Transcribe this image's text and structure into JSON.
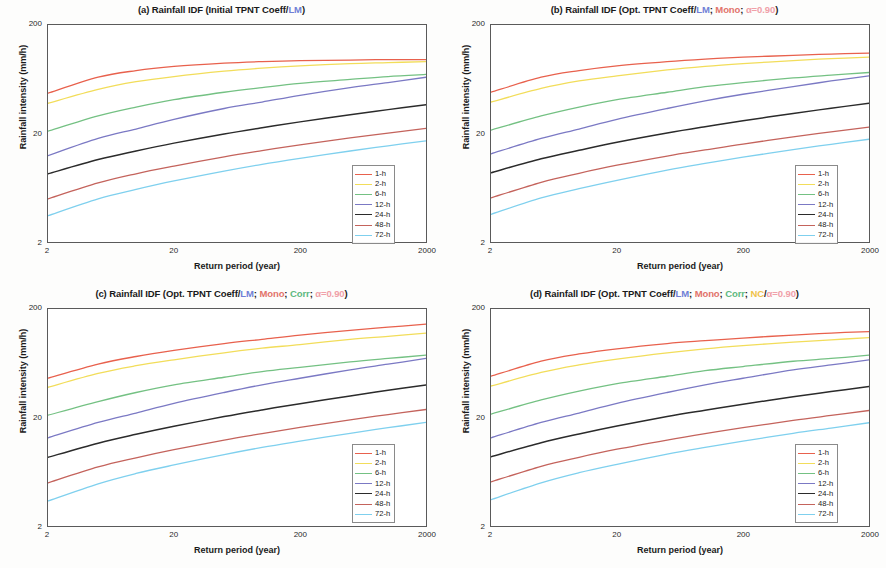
{
  "figure": {
    "background": "#fdfdfc",
    "panel_count": 4
  },
  "axes": {
    "xlabel": "Return period (year)",
    "ylabel": "Rainfall intensity (mm/h)",
    "xticks": [
      "2",
      "20",
      "200",
      "2000"
    ],
    "yticks": [
      "200",
      "20",
      "2"
    ],
    "xscale": "log",
    "yscale": "log",
    "xlim": [
      2,
      2000
    ],
    "ylim": [
      2,
      200
    ],
    "grid": false,
    "frame_color": "#5a5a5a"
  },
  "legend": {
    "position": "lower-right",
    "entries": [
      {
        "label": "1-h",
        "color": "#e8614d"
      },
      {
        "label": "2-h",
        "color": "#f2dd5a"
      },
      {
        "label": "6-h",
        "color": "#74c183"
      },
      {
        "label": "12-h",
        "color": "#7b79c4"
      },
      {
        "label": "24-h",
        "color": "#2b2b2b"
      },
      {
        "label": "48-h",
        "color": "#c4635c"
      },
      {
        "label": "72-h",
        "color": "#7fd0ee"
      }
    ]
  },
  "panels": [
    {
      "id": "a",
      "title_plain": "(a) Rainfall IDF (Initial TPNT Coeff/LM)",
      "title_tokens": [
        {
          "text": "(a) Rainfall IDF (Initial TPNT Coeff/",
          "style": "plain"
        },
        {
          "text": "LM",
          "style": "lm"
        },
        {
          "text": ")",
          "style": "plain"
        }
      ]
    },
    {
      "id": "b",
      "title_plain": "(b) Rainfall IDF (Opt. TPNT Coeff/LM; Mono; α=0.90)",
      "title_tokens": [
        {
          "text": "(b) Rainfall IDF (Opt. TPNT Coeff/",
          "style": "plain"
        },
        {
          "text": "LM",
          "style": "lm"
        },
        {
          "text": "; ",
          "style": "plain"
        },
        {
          "text": "Mono",
          "style": "mono"
        },
        {
          "text": "; ",
          "style": "plain"
        },
        {
          "text": "α=0.90",
          "style": "alpha"
        },
        {
          "text": ")",
          "style": "plain"
        }
      ]
    },
    {
      "id": "c",
      "title_plain": "(c) Rainfall IDF (Opt. TPNT Coeff/LM; Mono; Corr; α=0.90)",
      "title_tokens": [
        {
          "text": "(c) Rainfall IDF (Opt. TPNT Coeff/",
          "style": "plain"
        },
        {
          "text": "LM",
          "style": "lm"
        },
        {
          "text": "; ",
          "style": "plain"
        },
        {
          "text": "Mono",
          "style": "mono"
        },
        {
          "text": "; ",
          "style": "plain"
        },
        {
          "text": "Corr",
          "style": "corr"
        },
        {
          "text": "; ",
          "style": "plain"
        },
        {
          "text": "α=0.90",
          "style": "alpha"
        },
        {
          "text": ")",
          "style": "plain"
        }
      ]
    },
    {
      "id": "d",
      "title_plain": "(d) Rainfall IDF (Opt. TPNT Coeff/LM; Mono; Corr; NC/α=0.90)",
      "title_tokens": [
        {
          "text": "(d) Rainfall IDF (Opt. TPNT Coeff/",
          "style": "plain"
        },
        {
          "text": "LM",
          "style": "lm"
        },
        {
          "text": "; ",
          "style": "plain"
        },
        {
          "text": "Mono",
          "style": "mono"
        },
        {
          "text": "; ",
          "style": "plain"
        },
        {
          "text": "Corr",
          "style": "corr"
        },
        {
          "text": "; ",
          "style": "plain"
        },
        {
          "text": "NC",
          "style": "nc"
        },
        {
          "text": "/",
          "style": "plain"
        },
        {
          "text": "α=0.90",
          "style": "alpha"
        },
        {
          "text": ")",
          "style": "plain"
        }
      ]
    }
  ],
  "chart_data": [
    {
      "type": "line",
      "panel": "a",
      "title": "(a) Rainfall IDF (Initial TPNT Coeff/LM)",
      "xlabel": "Return period (year)",
      "ylabel": "Rainfall intensity (mm/h)",
      "xscale": "log",
      "yscale": "log",
      "xlim": [
        2,
        2000
      ],
      "ylim": [
        2,
        200
      ],
      "x": [
        2,
        5,
        10,
        20,
        50,
        100,
        200,
        500,
        1000,
        2000
      ],
      "series": [
        {
          "name": "1-h",
          "color": "#e8614d",
          "values": [
            47,
            66,
            76,
            83,
            89,
            92,
            94,
            95,
            96,
            96
          ]
        },
        {
          "name": "2-h",
          "color": "#f2dd5a",
          "values": [
            38,
            51,
            60,
            67,
            75,
            80,
            84,
            88,
            90,
            92
          ]
        },
        {
          "name": "6-h",
          "color": "#74c183",
          "values": [
            21,
            29,
            35,
            41,
            48,
            53,
            58,
            63,
            67,
            70
          ]
        },
        {
          "name": "12-h",
          "color": "#7b79c4",
          "values": [
            12.5,
            18,
            22,
            27,
            34,
            39,
            45,
            53,
            59,
            66
          ]
        },
        {
          "name": "24-h",
          "color": "#2b2b2b",
          "values": [
            8.5,
            11.5,
            13.8,
            16.3,
            19.8,
            22.6,
            25.6,
            29.8,
            33.2,
            36.8
          ]
        },
        {
          "name": "48-h",
          "color": "#c4635c",
          "values": [
            5.0,
            7.0,
            8.5,
            10.0,
            12.2,
            13.9,
            15.7,
            18.2,
            20.2,
            22.3
          ]
        },
        {
          "name": "72-h",
          "color": "#7fd0ee",
          "values": [
            3.5,
            5.0,
            6.1,
            7.3,
            9.0,
            10.4,
            11.8,
            13.8,
            15.4,
            17.1
          ]
        }
      ]
    },
    {
      "type": "line",
      "panel": "b",
      "title": "(b) Rainfall IDF (Opt. TPNT Coeff/LM; Mono; α=0.90)",
      "xlabel": "Return period (year)",
      "ylabel": "Rainfall intensity (mm/h)",
      "xscale": "log",
      "yscale": "log",
      "xlim": [
        2,
        2000
      ],
      "ylim": [
        2,
        200
      ],
      "x": [
        2,
        5,
        10,
        20,
        50,
        100,
        200,
        500,
        1000,
        2000
      ],
      "series": [
        {
          "name": "1-h",
          "color": "#e8614d",
          "values": [
            48,
            66,
            76,
            84,
            92,
            97,
            101,
            105,
            108,
            110
          ]
        },
        {
          "name": "2-h",
          "color": "#f2dd5a",
          "values": [
            39,
            52,
            61,
            68,
            77,
            83,
            88,
            94,
            98,
            101
          ]
        },
        {
          "name": "6-h",
          "color": "#74c183",
          "values": [
            21.5,
            29,
            35,
            41,
            48,
            54,
            59,
            65,
            69,
            73
          ]
        },
        {
          "name": "12-h",
          "color": "#7b79c4",
          "values": [
            13,
            18,
            22,
            27,
            34,
            40,
            46,
            54,
            61,
            68
          ]
        },
        {
          "name": "24-h",
          "color": "#2b2b2b",
          "values": [
            8.7,
            11.7,
            14.0,
            16.6,
            20.2,
            23.1,
            26.2,
            30.6,
            34.2,
            38.0
          ]
        },
        {
          "name": "48-h",
          "color": "#c4635c",
          "values": [
            5.1,
            7.1,
            8.6,
            10.2,
            12.4,
            14.1,
            16.0,
            18.6,
            20.7,
            22.9
          ]
        },
        {
          "name": "72-h",
          "color": "#7fd0ee",
          "values": [
            3.6,
            5.1,
            6.2,
            7.4,
            9.2,
            10.6,
            12.1,
            14.2,
            15.9,
            17.7
          ]
        }
      ]
    },
    {
      "type": "line",
      "panel": "c",
      "title": "(c) Rainfall IDF (Opt. TPNT Coeff/LM; Mono; Corr; α=0.90)",
      "xlabel": "Return period (year)",
      "ylabel": "Rainfall intensity (mm/h)",
      "xscale": "log",
      "yscale": "log",
      "xlim": [
        2,
        2000
      ],
      "ylim": [
        2,
        200
      ],
      "x": [
        2,
        5,
        10,
        20,
        50,
        100,
        200,
        500,
        1000,
        2000
      ],
      "series": [
        {
          "name": "1-h",
          "color": "#e8614d",
          "values": [
            46,
            62,
            73,
            83,
            96,
            105,
            115,
            127,
            136,
            145
          ]
        },
        {
          "name": "2-h",
          "color": "#f2dd5a",
          "values": [
            38,
            51,
            60,
            68,
            79,
            87,
            94,
            105,
            112,
            120
          ]
        },
        {
          "name": "6-h",
          "color": "#74c183",
          "values": [
            21,
            28,
            34,
            40,
            47,
            53,
            58,
            65,
            70,
            75
          ]
        },
        {
          "name": "12-h",
          "color": "#7b79c4",
          "values": [
            13,
            18,
            22,
            27,
            34,
            40,
            46,
            55,
            62,
            70
          ]
        },
        {
          "name": "24-h",
          "color": "#2b2b2b",
          "values": [
            8.6,
            11.6,
            14.0,
            16.6,
            20.4,
            23.5,
            26.8,
            31.6,
            35.6,
            39.8
          ]
        },
        {
          "name": "48-h",
          "color": "#c4635c",
          "values": [
            5.0,
            7.0,
            8.5,
            10.1,
            12.4,
            14.2,
            16.2,
            19.0,
            21.3,
            23.7
          ]
        },
        {
          "name": "72-h",
          "color": "#7fd0ee",
          "values": [
            3.4,
            4.9,
            6.1,
            7.3,
            9.1,
            10.6,
            12.1,
            14.3,
            16.1,
            18.0
          ]
        }
      ]
    },
    {
      "type": "line",
      "panel": "d",
      "title": "(d) Rainfall IDF (Opt. TPNT Coeff/LM; Mono; Corr; NC/α=0.90)",
      "xlabel": "Return period (year)",
      "ylabel": "Rainfall intensity (mm/h)",
      "xscale": "log",
      "yscale": "log",
      "xlim": [
        2,
        2000
      ],
      "ylim": [
        2,
        200
      ],
      "x": [
        2,
        5,
        10,
        20,
        50,
        100,
        200,
        500,
        1000,
        2000
      ],
      "series": [
        {
          "name": "1-h",
          "color": "#e8614d",
          "values": [
            48,
            66,
            77,
            86,
            96,
            102,
            108,
            115,
            120,
            124
          ]
        },
        {
          "name": "2-h",
          "color": "#f2dd5a",
          "values": [
            39,
            52,
            61,
            69,
            79,
            86,
            92,
            99,
            104,
            109
          ]
        },
        {
          "name": "6-h",
          "color": "#74c183",
          "values": [
            21.5,
            29,
            35,
            41,
            48,
            54,
            59,
            66,
            70,
            75
          ]
        },
        {
          "name": "12-h",
          "color": "#7b79c4",
          "values": [
            13,
            18,
            22,
            27,
            34,
            40,
            46,
            55,
            61,
            68
          ]
        },
        {
          "name": "24-h",
          "color": "#2b2b2b",
          "values": [
            8.7,
            11.7,
            14.1,
            16.7,
            20.4,
            23.3,
            26.5,
            31.0,
            34.7,
            38.6
          ]
        },
        {
          "name": "48-h",
          "color": "#c4635c",
          "values": [
            5.1,
            7.1,
            8.6,
            10.2,
            12.4,
            14.2,
            16.1,
            18.8,
            20.9,
            23.2
          ]
        },
        {
          "name": "72-h",
          "color": "#7fd0ee",
          "values": [
            3.5,
            5.0,
            6.2,
            7.4,
            9.2,
            10.6,
            12.1,
            14.3,
            16.0,
            17.9
          ]
        }
      ]
    }
  ]
}
